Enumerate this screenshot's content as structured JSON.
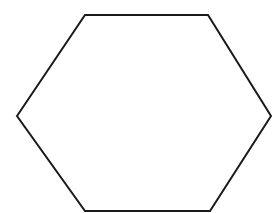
{
  "canvas": {
    "width": 279,
    "height": 213,
    "background_color": "#ffffff",
    "description": "Line drawing of a single regular hexagon outline on a plain white background"
  },
  "figure": {
    "name": "hexagon",
    "shape_type": "hexagon",
    "sides": 6,
    "orientation": "pointy-left-right",
    "fill_color": "#ffffff",
    "stroke_color": "#1a1a1a",
    "stroke_width": 2,
    "vertices": [
      {
        "label": "left",
        "x": 17,
        "y": 116
      },
      {
        "label": "top-left",
        "x": 85,
        "y": 15
      },
      {
        "label": "top-right",
        "x": 208,
        "y": 15
      },
      {
        "label": "right",
        "x": 271,
        "y": 116
      },
      {
        "label": "bottom-right",
        "x": 210,
        "y": 211
      },
      {
        "label": "bottom-left",
        "x": 85,
        "y": 211
      }
    ],
    "points_string": "17,116 85,15 208,15 271,116 210,211 85,211"
  }
}
